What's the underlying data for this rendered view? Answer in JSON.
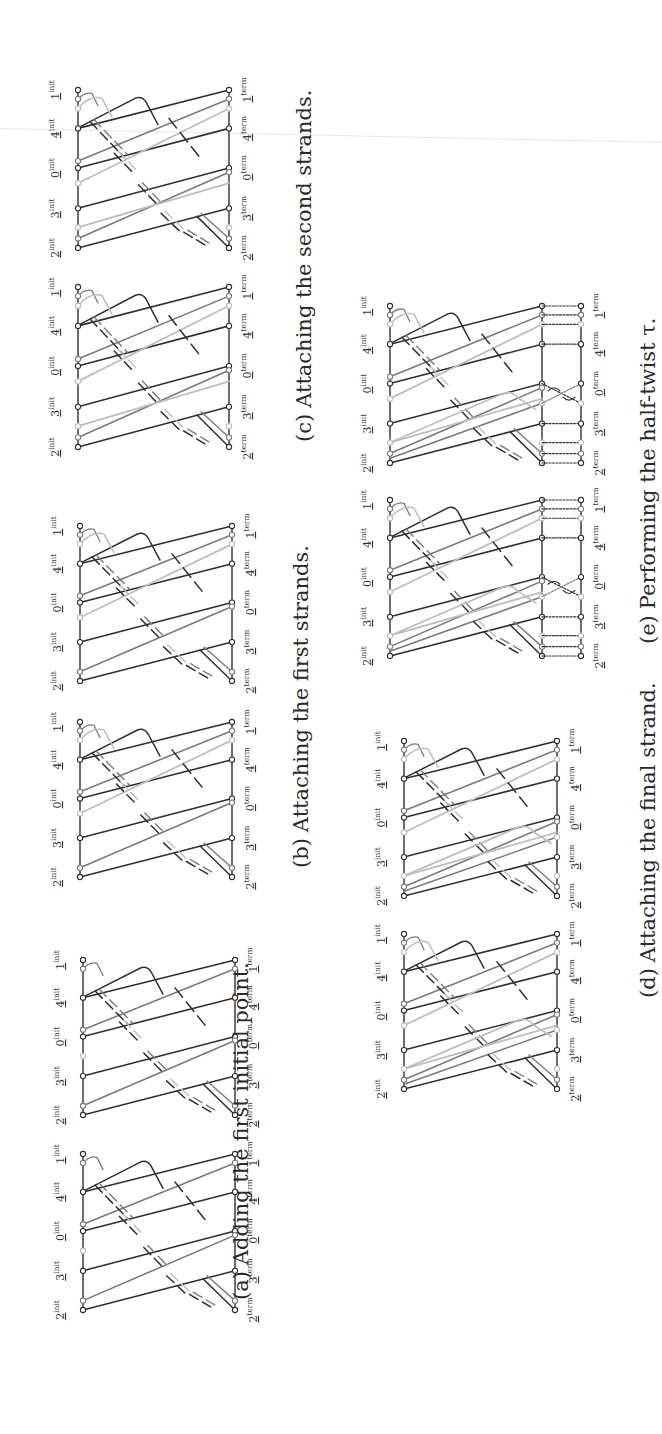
{
  "figure": {
    "orientation": "rotated-90-ccw",
    "colors": {
      "dark": "#2f2f2f",
      "medium": "#7a7a7a",
      "light": "#bdbdbd",
      "label": "#3a3a3a",
      "caption": "#2a2a2a"
    },
    "point_labels": {
      "init": [
        "2",
        "3",
        "0",
        "4",
        "1"
      ],
      "init_superscript": "init",
      "term": [
        "2",
        "3",
        "0",
        "4",
        "1"
      ],
      "term_superscript": "term"
    },
    "panels": [
      {
        "id": "a",
        "tag": "(a)",
        "caption": "Adding the first initial point.",
        "caption_x": 229,
        "caption_bottom": 1300,
        "stage": 1,
        "diagrams": [
          {
            "top": 960,
            "bottom": 1115,
            "init_x": 83,
            "term_x": 235
          },
          {
            "top": 1154,
            "bottom": 1310,
            "init_x": 83,
            "term_x": 235
          }
        ]
      },
      {
        "id": "b",
        "tag": "(b)",
        "caption": "Attaching the first strands.",
        "caption_x": 289,
        "caption_bottom": 868,
        "stage": 2,
        "diagrams": [
          {
            "top": 526,
            "bottom": 681,
            "init_x": 80,
            "term_x": 232
          },
          {
            "top": 722,
            "bottom": 877,
            "init_x": 80,
            "term_x": 232
          }
        ]
      },
      {
        "id": "c",
        "tag": "(c)",
        "caption": "Attaching the second strands.",
        "caption_x": 292,
        "caption_bottom": 442,
        "stage": 3,
        "diagrams": [
          {
            "top": 90,
            "bottom": 248,
            "init_x": 78,
            "term_x": 229
          },
          {
            "top": 287,
            "bottom": 447,
            "init_x": 78,
            "term_x": 229
          }
        ]
      },
      {
        "id": "d",
        "tag": "(d)",
        "caption": "Attaching the final strand.",
        "caption_x": 636,
        "caption_bottom": 998,
        "stage": 4,
        "diagrams": [
          {
            "top": 741,
            "bottom": 896,
            "init_x": 404,
            "term_x": 557
          },
          {
            "top": 934,
            "bottom": 1089,
            "init_x": 404,
            "term_x": 557
          }
        ]
      },
      {
        "id": "e",
        "tag": "(e)",
        "caption": "Performing the half-twist τ.",
        "caption_x": 636,
        "caption_bottom": 644,
        "stage": 5,
        "diagrams": [
          {
            "top": 306,
            "bottom": 463,
            "init_x": 390,
            "term_x": 542,
            "twist_x": 581
          },
          {
            "top": 500,
            "bottom": 656,
            "init_x": 390,
            "term_x": 542,
            "twist_x": 581
          }
        ]
      }
    ]
  }
}
